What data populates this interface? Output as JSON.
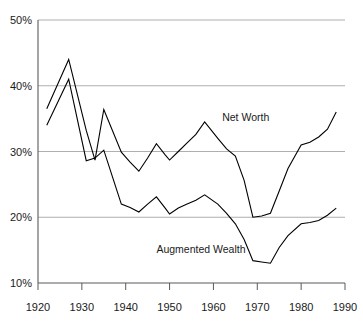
{
  "chart_data": {
    "type": "line",
    "title": "",
    "subtitle": "",
    "xlabel": "",
    "ylabel": "",
    "xlim": [
      1920,
      1990
    ],
    "ylim": [
      10,
      50
    ],
    "grid": true,
    "grid_axis": "y",
    "legend_position": "inline-annotation",
    "y_tick_labels": [
      "50%",
      "40%",
      "30%",
      "20%",
      "10%"
    ],
    "y_tick_values": [
      50,
      40,
      30,
      20,
      10
    ],
    "x_tick_labels": [
      "1920",
      "1930",
      "1940",
      "1950",
      "1960",
      "1970",
      "1980",
      "1990"
    ],
    "x_tick_values": [
      1920,
      1930,
      1940,
      1950,
      1960,
      1970,
      1980,
      1990
    ],
    "y_unit": "percent",
    "series": [
      {
        "name": "Net Worth",
        "label_x": 1962,
        "label_y": 34.6,
        "color": "#000000",
        "x": [
          1922,
          1927,
          1931,
          1933,
          1935,
          1939,
          1941,
          1943,
          1945,
          1947,
          1949,
          1950,
          1952,
          1954,
          1956,
          1958,
          1961,
          1963,
          1965,
          1967,
          1969,
          1971,
          1973,
          1975,
          1977,
          1980,
          1982,
          1984,
          1986,
          1988
        ],
        "values": [
          36.5,
          44.0,
          33.2,
          28.7,
          36.4,
          29.9,
          28.4,
          27.0,
          29.0,
          31.2,
          29.5,
          28.7,
          30.0,
          31.3,
          32.6,
          34.5,
          32.0,
          30.4,
          29.3,
          25.6,
          20.0,
          20.2,
          20.6,
          24.0,
          27.4,
          31.0,
          31.4,
          32.2,
          33.4,
          36.0
        ]
      },
      {
        "name": "Augmented Wealth",
        "label_x": 1947,
        "label_y": 14.6,
        "color": "#000000",
        "x": [
          1922,
          1927,
          1931,
          1933,
          1935,
          1939,
          1941,
          1943,
          1945,
          1947,
          1949,
          1950,
          1952,
          1954,
          1956,
          1958,
          1961,
          1963,
          1965,
          1967,
          1969,
          1971,
          1973,
          1975,
          1977,
          1980,
          1982,
          1984,
          1986,
          1988
        ],
        "values": [
          34.0,
          41.0,
          28.6,
          29.0,
          30.2,
          22.0,
          21.5,
          20.8,
          22.0,
          23.1,
          21.4,
          20.5,
          21.4,
          22.0,
          22.6,
          23.4,
          22.0,
          20.6,
          19.0,
          16.6,
          13.4,
          13.2,
          13.0,
          15.4,
          17.2,
          19.0,
          19.2,
          19.5,
          20.3,
          21.4
        ]
      }
    ]
  },
  "layout": {
    "plot_left": 38,
    "plot_right": 345,
    "plot_top": 20,
    "plot_bottom": 283
  }
}
